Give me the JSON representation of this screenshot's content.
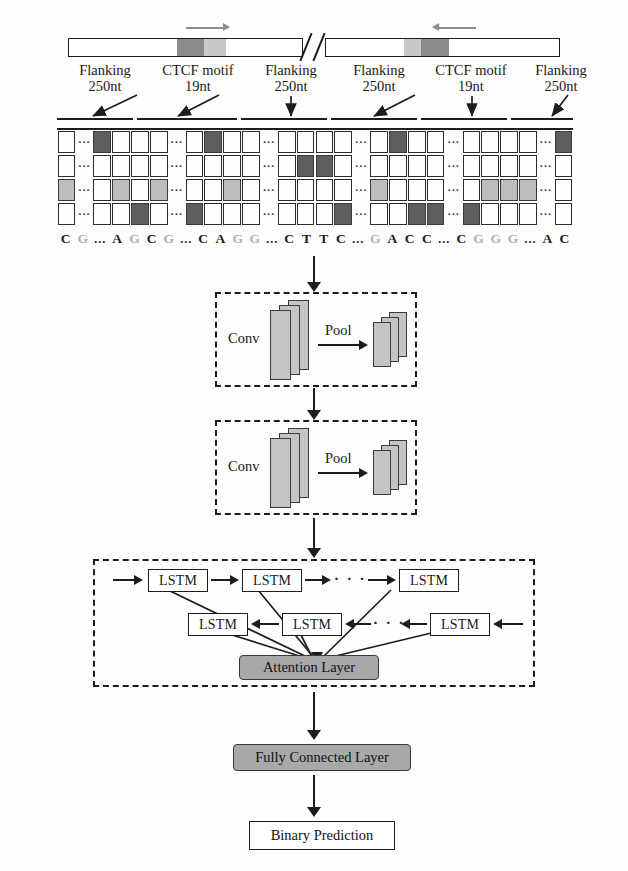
{
  "figure": {
    "colors": {
      "motif_dark": "#8a8a8a",
      "motif_light": "#c9c9c9",
      "cell_dark": "#5e5e5e",
      "cell_light": "#bdbdbd",
      "gray_block": "#a8a8a8",
      "slab": "#c4c4c4",
      "stroke": "#1d1d1d"
    }
  },
  "dna": {
    "left_arrow_direction": "right",
    "right_arrow_direction": "left",
    "break_symbol": "//",
    "segments": [
      {
        "name": "Flanking",
        "length": "250nt",
        "pointer": "diag-left"
      },
      {
        "name": "CTCF motif",
        "length": "19nt",
        "pointer": "diag-left"
      },
      {
        "name": "Flanking",
        "length": "250nt",
        "pointer": "down"
      },
      {
        "name": "Flanking",
        "length": "250nt",
        "pointer": "diag-left"
      },
      {
        "name": "CTCF motif",
        "length": "19nt",
        "pointer": "down"
      },
      {
        "name": "Flanking",
        "length": "250nt",
        "pointer": "diag-left"
      }
    ]
  },
  "onehot": {
    "rows": 4,
    "row_labels": [
      "A",
      "C",
      "G",
      "T"
    ],
    "ellipsis": "···",
    "columns": 28,
    "dot_columns": [
      1,
      6,
      11,
      16,
      21,
      26
    ],
    "matrix": [
      [
        "",
        "d",
        "D",
        "",
        "",
        "",
        "d",
        "",
        "D",
        "",
        "",
        "d",
        "",
        "",
        "",
        "",
        "d",
        "",
        "D",
        "",
        "",
        "d",
        "",
        "",
        "",
        "",
        "d",
        "D"
      ],
      [
        "",
        "d",
        "",
        "",
        "",
        "",
        "d",
        "",
        "",
        "",
        "",
        "d",
        "",
        "D",
        "D",
        "",
        "d",
        "",
        "",
        "",
        "",
        "d",
        "",
        "",
        "",
        "",
        "d",
        ""
      ],
      [
        "L",
        "d",
        "",
        "L",
        "",
        "L",
        "d",
        "",
        "",
        "L",
        "",
        "d",
        "",
        "",
        "",
        "",
        "d",
        "L",
        "",
        "",
        "",
        "d",
        "",
        "L",
        "L",
        "L",
        "d",
        ""
      ],
      [
        "",
        "d",
        "",
        "",
        "D",
        "",
        "d",
        "D",
        "",
        "",
        "",
        "d",
        "",
        "",
        "",
        "D",
        "d",
        "",
        "",
        "D",
        "D",
        "d",
        "D",
        "",
        "",
        "",
        "d",
        ""
      ]
    ],
    "sequence": [
      {
        "c": "C",
        "faint": false
      },
      {
        "c": "G",
        "faint": true
      },
      {
        "c": "…",
        "dots": true
      },
      {
        "c": "A",
        "faint": false
      },
      {
        "c": "G",
        "faint": true
      },
      {
        "c": "C",
        "faint": false
      },
      {
        "c": "G",
        "faint": true
      },
      {
        "c": "…",
        "dots": true
      },
      {
        "c": "C",
        "faint": false
      },
      {
        "c": "A",
        "faint": false
      },
      {
        "c": "G",
        "faint": true
      },
      {
        "c": "G",
        "faint": true
      },
      {
        "c": "…",
        "dots": true
      },
      {
        "c": "C",
        "faint": false
      },
      {
        "c": "T",
        "faint": false
      },
      {
        "c": "T",
        "faint": false
      },
      {
        "c": "C",
        "faint": false
      },
      {
        "c": "…",
        "dots": true
      },
      {
        "c": "G",
        "faint": true
      },
      {
        "c": "A",
        "faint": false
      },
      {
        "c": "C",
        "faint": false
      },
      {
        "c": "C",
        "faint": false
      },
      {
        "c": "…",
        "dots": true
      },
      {
        "c": "C",
        "faint": false
      },
      {
        "c": "G",
        "faint": true
      },
      {
        "c": "G",
        "faint": true
      },
      {
        "c": "G",
        "faint": true
      },
      {
        "c": "…",
        "dots": true
      },
      {
        "c": "A",
        "faint": false
      },
      {
        "c": "C",
        "faint": false
      }
    ]
  },
  "blocks": {
    "conv1": {
      "conv_label": "Conv",
      "pool_label": "Pool"
    },
    "conv2": {
      "conv_label": "Conv",
      "pool_label": "Pool"
    },
    "lstm": {
      "label": "LSTM",
      "ellipsis": "· · ·",
      "forward_count": 3,
      "backward_count": 3,
      "attention_label": "Attention Layer"
    },
    "fully_connected_label": "Fully Connected Layer",
    "output_label": "Binary Prediction"
  }
}
